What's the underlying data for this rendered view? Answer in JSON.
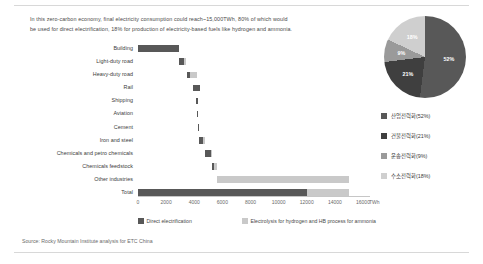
{
  "intro": {
    "line1": "In this zero-carbon economy, final electricity consumption could reach~15,000TWh, 80% of which would",
    "line2": "be used for direct electrification, 18% for production of electricity-based fuels like hydrogen and ammonia."
  },
  "source": {
    "text": "Source: Rocky Mountain Institute analysis for ETC China"
  },
  "legend": {
    "direct": "Direct electrification",
    "electrolysis": "Electrolysis for hydrogen and HB process for ammonia"
  },
  "colors": {
    "direct": "#585858",
    "electrolysis": "#c9c9c9",
    "pie_industry": "#585858",
    "pie_building": "#3f3f3f",
    "pie_transport": "#9a9a9a",
    "pie_hydrogen": "#cfcfcf"
  },
  "chart_data": {
    "type": "bar",
    "title": "",
    "xlabel": "TWh",
    "ylabel": "",
    "xlim": [
      0,
      16500
    ],
    "xticks": [
      "0",
      "2000",
      "4000",
      "6000",
      "8000",
      "10000",
      "12000",
      "14000",
      "16000"
    ],
    "xtick_values": [
      0,
      2000,
      4000,
      6000,
      8000,
      10000,
      12000,
      14000,
      16000
    ],
    "unit_label": "TWh",
    "grid": false,
    "legend_position": "bottom",
    "categories": [
      "Building",
      "Light-duty road",
      "Heavy-duty road",
      "Rail",
      "Shipping",
      "Aviation",
      "Cement",
      "Iron and steel",
      "Chemicals and petro chemicals",
      "Chemicals feedstock",
      "Other industries",
      "Total"
    ],
    "series": [
      {
        "name": "Direct electrification",
        "starts": [
          0,
          2900,
          3450,
          3900,
          4100,
          4200,
          4280,
          4350,
          4800,
          5250,
          5600,
          0
        ],
        "values": [
          2900,
          350,
          260,
          480,
          170,
          100,
          80,
          290,
          390,
          180,
          0,
          12000
        ]
      },
      {
        "name": "Electrolysis for hydrogen and HB process for ammonia",
        "starts": [
          2900,
          3250,
          3710,
          4380,
          4270,
          4300,
          4360,
          4640,
          5190,
          5430,
          5600,
          12000
        ],
        "values": [
          0,
          200,
          470,
          0,
          0,
          0,
          0,
          160,
          60,
          170,
          9400,
          3000
        ]
      }
    ]
  },
  "pie": {
    "type": "pie",
    "slices": [
      {
        "label": "산업전력화(52%)",
        "short": "52%",
        "value": 52,
        "color": "#585858"
      },
      {
        "label": "건물전력화(21%)",
        "short": "21%",
        "value": 21,
        "color": "#3f3f3f"
      },
      {
        "label": "운송전력화(9%)",
        "short": "9%",
        "value": 9,
        "color": "#9a9a9a"
      },
      {
        "label": "수소전력화(18%)",
        "short": "18%",
        "value": 18,
        "color": "#cfcfcf"
      }
    ]
  }
}
